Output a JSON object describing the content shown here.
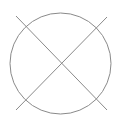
{
  "diagram": {
    "background": "#ffffff",
    "stroke_color": "#8a8a8a",
    "circle": {
      "cx": 60.5,
      "cy": 63.5,
      "r": 50.5
    },
    "lines": [
      {
        "x1": 16,
        "y1": 16,
        "x2": 107,
        "y2": 110
      },
      {
        "x1": 16,
        "y1": 110,
        "x2": 107,
        "y2": 17
      }
    ]
  }
}
